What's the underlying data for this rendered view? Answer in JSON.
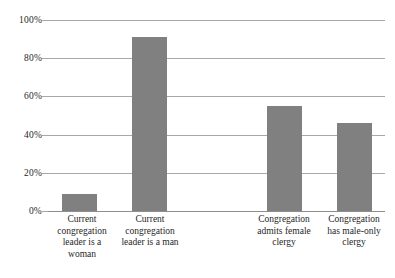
{
  "chart_data": {
    "type": "bar",
    "title": "",
    "subtitle": "",
    "xlabel": "",
    "ylabel": "",
    "ylim": [
      0,
      100
    ],
    "y_tick_labels": [
      "0%",
      "20%",
      "40%",
      "60%",
      "80%",
      "100%"
    ],
    "y_tick_values": [
      0,
      20,
      40,
      60,
      80,
      100
    ],
    "grid": "horizontal",
    "legend": "none",
    "bar_color": "#808080",
    "gridline_color": "#a8a8a8",
    "axis_color": "#8e8e8e",
    "categories": [
      "Current congregation leader is a woman",
      "Current congregation leader is a man",
      "Congregation admits female clergy",
      "Congregation has male-only clergy"
    ],
    "category_lines": [
      [
        "Current",
        "congregation",
        "leader is a",
        "woman"
      ],
      [
        "Current",
        "congregation",
        "leader is a man"
      ],
      [
        "Congregation",
        "admits female",
        "clergy"
      ],
      [
        "Congregation",
        "has male-only",
        "clergy"
      ]
    ],
    "values": [
      9,
      91,
      55,
      46
    ],
    "series": [
      {
        "name": "Percent",
        "values": [
          9,
          91,
          55,
          46
        ]
      }
    ]
  },
  "axis": {
    "tick_0": "0%",
    "tick_20": "20%",
    "tick_40": "40%",
    "tick_60": "60%",
    "tick_80": "80%",
    "tick_100": "100%"
  },
  "labels": {
    "cat0_line0": "Current",
    "cat0_line1": "congregation",
    "cat0_line2": "leader is a",
    "cat0_line3": "woman",
    "cat1_line0": "Current",
    "cat1_line1": "congregation",
    "cat1_line2": "leader is a man",
    "cat2_line0": "Congregation",
    "cat2_line1": "admits female",
    "cat2_line2": "clergy",
    "cat3_line0": "Congregation",
    "cat3_line1": "has male-only",
    "cat3_line2": "clergy"
  }
}
